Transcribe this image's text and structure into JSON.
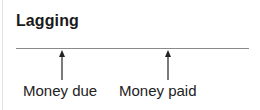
{
  "title": "Lagging",
  "timeline": {
    "line_color": "#8a8a8a",
    "markers": [
      {
        "label": "Money due",
        "x": 62
      },
      {
        "label": "Money paid",
        "x": 168
      }
    ]
  }
}
